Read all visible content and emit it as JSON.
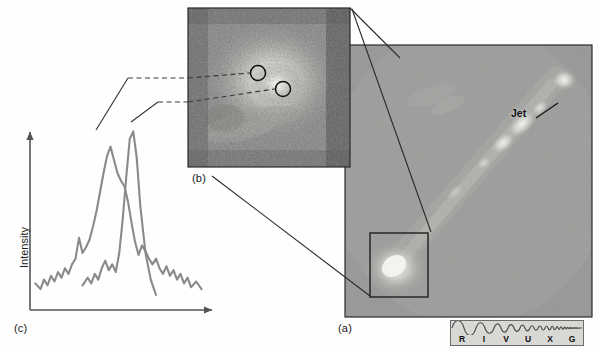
{
  "figure": {
    "kind": "astronomy-multipanel-figure",
    "background": "#fefefe"
  },
  "panels": {
    "a": {
      "label": "(a)",
      "caption_position": "below-left",
      "description": "wide-field grayscale image of an active galaxy with a jet",
      "annotations": [
        {
          "name": "jet-label",
          "text": "Jet"
        }
      ],
      "inset_box": {
        "name": "nucleus-zoom-box"
      },
      "bounds": {
        "x": 345,
        "y": 45,
        "w": 247,
        "h": 272
      },
      "image_colors": {
        "background": "#9c9c9c",
        "bright": "#f2f2ee",
        "dark": "#6f6f6f"
      }
    },
    "b": {
      "label": "(b)",
      "description": "high-resolution close-up of the galaxy nucleus with two marked emission regions",
      "markers": [
        {
          "name": "emission-region-marker-1"
        },
        {
          "name": "emission-region-marker-2"
        }
      ],
      "bounds": {
        "x": 188,
        "y": 8,
        "w": 162,
        "h": 159
      },
      "image_colors": {
        "background": "#8e8e8e",
        "bright": "#efefe9",
        "dark": "#2f2f2f"
      }
    },
    "c": {
      "label": "(c)",
      "description": "spectral line intensity profiles from the two marked regions",
      "y_axis_label": "Intensity",
      "curves": [
        {
          "name": "blueshifted-peak-curve",
          "color": "#8a8a8a"
        },
        {
          "name": "redshifted-peak-curve",
          "color": "#8a8a8a"
        }
      ]
    }
  },
  "spectrum_bar": {
    "name": "em-spectrum-band-indicator",
    "letters": [
      "R",
      "I",
      "V",
      "U",
      "X",
      "G"
    ],
    "highlighted": "V",
    "colors": {
      "fill": "#d8d8d4",
      "border": "#6c6c6c",
      "wave": "#555555"
    }
  },
  "chart_data": {
    "type": "line",
    "title": "",
    "xlabel": "",
    "ylabel": "Intensity",
    "grid": false,
    "legend": false,
    "axis_arrows": true,
    "xlim": [
      0,
      100
    ],
    "ylim": [
      0,
      100
    ],
    "series": [
      {
        "name": "Region 1 (broad, left peak)",
        "color": "#8a8a8a",
        "x": [
          3,
          6,
          8,
          10,
          12,
          14,
          16,
          18,
          20,
          22,
          24,
          26,
          28,
          30,
          32,
          34,
          36,
          38,
          40,
          42,
          44,
          46,
          48,
          50,
          52,
          54,
          56,
          58,
          60,
          62,
          64,
          66,
          68,
          70,
          72,
          74,
          76,
          78,
          80,
          82,
          84,
          86,
          88,
          90,
          92,
          95,
          98
        ],
        "y": [
          14,
          11,
          16,
          13,
          18,
          15,
          20,
          17,
          22,
          19,
          24,
          27,
          38,
          30,
          33,
          37,
          44,
          52,
          62,
          72,
          81,
          86,
          79,
          72,
          68,
          65,
          57,
          46,
          36,
          29,
          34,
          31,
          27,
          24,
          27,
          22,
          19,
          23,
          18,
          21,
          16,
          19,
          14,
          17,
          12,
          15,
          11
        ]
      },
      {
        "name": "Region 2 (narrow, right peak)",
        "color": "#8a8a8a",
        "x": [
          30,
          33,
          35,
          37,
          39,
          41,
          43,
          45,
          47,
          49,
          51,
          53,
          55,
          57,
          59,
          61,
          63,
          66,
          69,
          72
        ],
        "y": [
          13,
          17,
          14,
          19,
          16,
          22,
          26,
          21,
          24,
          20,
          30,
          48,
          70,
          90,
          94,
          80,
          55,
          30,
          16,
          8
        ]
      }
    ]
  },
  "connectors": [
    {
      "name": "peak1-to-marker1-leader",
      "style": "dashed"
    },
    {
      "name": "peak2-to-marker2-leader",
      "style": "dashed"
    },
    {
      "name": "panel-b-to-panel-a-top-leader",
      "style": "solid"
    },
    {
      "name": "panel-b-to-panel-a-bottom-leader",
      "style": "solid"
    }
  ]
}
